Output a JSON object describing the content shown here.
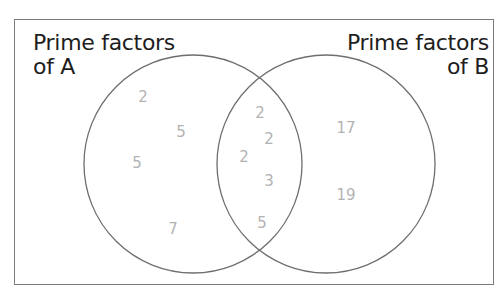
{
  "diagram": {
    "type": "venn",
    "set_a": {
      "label_line1": "Prime factors",
      "label_line2": "of A",
      "only": [
        "2",
        "5",
        "5",
        "7"
      ]
    },
    "set_b": {
      "label_line1": "Prime factors",
      "label_line2": "of B",
      "only": [
        "17",
        "19"
      ]
    },
    "intersection": [
      "2",
      "2",
      "2",
      "3",
      "5"
    ],
    "colors": {
      "frame": "#7a7a7a",
      "circle": "#6e6e6e",
      "label_text": "#1e1e1e",
      "number_text": "#b3b3b3"
    }
  }
}
